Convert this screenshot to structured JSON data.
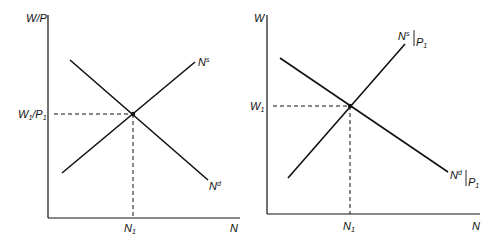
{
  "left_panel": {
    "y_axis_label": "W/P",
    "x_axis_label": "N",
    "y_tick_label_main": "W",
    "y_tick_label_sub1": "1",
    "y_tick_label_mid": "/P",
    "y_tick_label_sub2": "1",
    "x_tick_label_main": "N",
    "x_tick_label_sub": "1",
    "supply_label_main": "N",
    "supply_label_sup": "s",
    "demand_label_main": "N",
    "demand_label_sup": "d"
  },
  "right_panel": {
    "y_axis_label": "W",
    "x_axis_label": "N",
    "y_tick_label_main": "W",
    "y_tick_label_sub": "1",
    "x_tick_label_main": "N",
    "x_tick_label_sub": "1",
    "supply_label_main": "N",
    "supply_label_sup": "s",
    "supply_label_cond": "P",
    "supply_label_cond_sub": "1",
    "demand_label_main": "N",
    "demand_label_sup": "d",
    "demand_label_cond": "P",
    "demand_label_cond_sub": "1"
  },
  "colors": {
    "line": "#111111",
    "background": "#ffffff"
  }
}
